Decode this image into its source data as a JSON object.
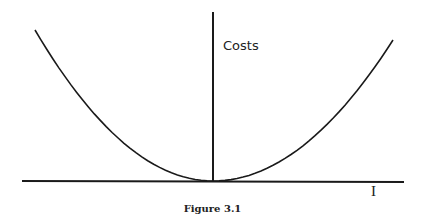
{
  "chart_data": {
    "type": "line",
    "title": "",
    "caption": "Figure 3.1",
    "xlabel": "I",
    "ylabel": "Costs",
    "grid": false,
    "legend": null,
    "series": [
      {
        "name": "Costs",
        "x": [
          -1.0,
          -0.75,
          -0.5,
          -0.25,
          0,
          0.25,
          0.5,
          0.75,
          1.0
        ],
        "y": [
          1.0,
          0.56,
          0.25,
          0.06,
          0,
          0.06,
          0.25,
          0.56,
          1.0
        ]
      }
    ],
    "xlim": [
      -1.05,
      1.05
    ],
    "ylim": [
      0,
      1.1
    ]
  },
  "labels": {
    "ylabel": "Costs",
    "xlabel": "I",
    "caption": "Figure 3.1"
  },
  "colors": {
    "line": "#1a1a1a",
    "background": "#ffffff"
  }
}
